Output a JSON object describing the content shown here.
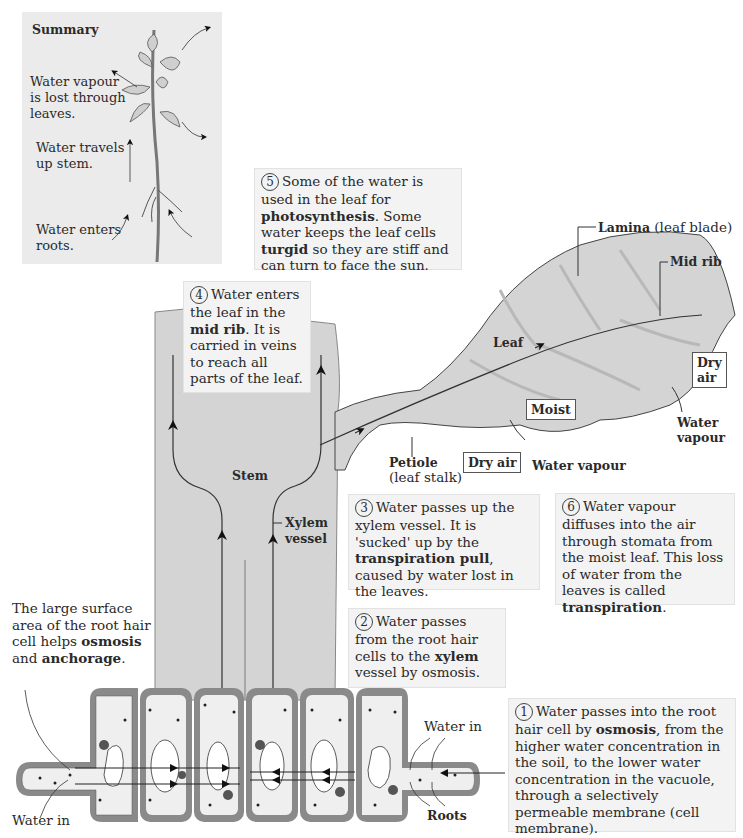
{
  "summary": {
    "title": "Summary",
    "vapour_text": [
      "Water vapour",
      "is lost through",
      "leaves."
    ],
    "stem_text": [
      "Water travels",
      "up stem."
    ],
    "roots_text": [
      "Water enters",
      "roots."
    ]
  },
  "steps": {
    "step1": {
      "number": "1",
      "text_a": "Water passes into the root hair cell by ",
      "bold": "osmosis",
      "text_b": ", from the higher water concentration in the soil, to the lower water concentration in the vacuole, through a selectively permeable membrane (cell membrane)."
    },
    "step2": {
      "number": "2",
      "text_a": "Water passes from the root hair cells to the ",
      "bold": "xylem",
      "text_b": " vessel by osmosis."
    },
    "step3": {
      "number": "3",
      "text_a": "Water passes up the xylem vessel. It is 'sucked' up by the ",
      "bold": "transpiration pull",
      "text_b": ", caused by water lost in the leaves."
    },
    "step4": {
      "number": "4",
      "text_a": "Water enters the leaf in the ",
      "bold": "mid rib",
      "text_b": ". It is carried in veins to reach all parts of the leaf."
    },
    "step5": {
      "number": "5",
      "text_a": "Some of the water is used in the leaf for ",
      "bold": "photosynthesis",
      "text_b": ". Some water keeps the leaf cells ",
      "bold2": "turgid",
      "text_c": " so they are stiff and can turn to face the sun."
    },
    "step6": {
      "number": "6",
      "text_a": "Water vapour diffuses into the air through stomata from the moist leaf. This loss of water from the leaves is called ",
      "bold": "transpiration",
      "text_b": "."
    }
  },
  "root_note": {
    "text_a": "The large surface area of the root hair cell helps ",
    "bold1": "osmosis",
    "mid": " and ",
    "bold2": "anchorage",
    "end": "."
  },
  "labels": {
    "lamina_bold": "Lamina",
    "lamina_rest": " (leaf blade)",
    "mid_rib": "Mid rib",
    "leaf": "Leaf",
    "dry_air_right": [
      "Dry",
      "air"
    ],
    "moist": "Moist",
    "water_vapour_right": [
      "Water",
      "vapour"
    ],
    "petiole_bold": "Petiole",
    "petiole_rest": "(leaf stalk)",
    "dry_air_bottom": "Dry air",
    "water_vapour_bottom": "Water vapour",
    "stem": "Stem",
    "xylem_vessel": [
      "Xylem",
      "vessel"
    ],
    "water_in_left": "Water in",
    "water_in_right": "Water in",
    "roots": "Roots"
  },
  "colors": {
    "plant_grey": "#d4d4d4",
    "box_bg": "#f3f3f3",
    "cell_wall": "#8a8a8a",
    "line": "#333333"
  }
}
